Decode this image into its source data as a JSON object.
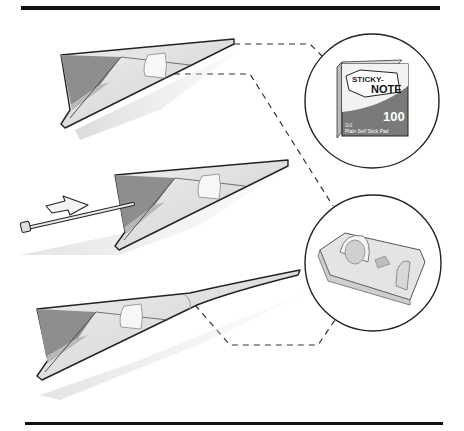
{
  "figure": {
    "type": "instruction-illustration",
    "steps": [
      {
        "id": "step-1",
        "description": "paper plane with sticky note tab"
      },
      {
        "id": "step-2",
        "description": "paper plane pierced with pin, arrow indicates push direction"
      },
      {
        "id": "step-3",
        "description": "paper plane with pin and tape wrapped nose"
      }
    ],
    "callouts": [
      {
        "id": "sticky-note-pad",
        "label_line1": "STICKY-",
        "label_line2": "NOTE",
        "count": "100",
        "sublabel_line1": "3x3",
        "sublabel_line2": "Plain Self Stick Pad"
      },
      {
        "id": "tape-dispenser"
      }
    ],
    "colors": {
      "rule": "#111111",
      "outline": "#222222",
      "paper_light": "#e6e6e6",
      "paper_mid": "#c9c9c9",
      "paper_dark": "#8a8a8a",
      "tape": "#f5f5f5",
      "box_dark": "#6a6a6a",
      "dash": "#333333"
    }
  }
}
